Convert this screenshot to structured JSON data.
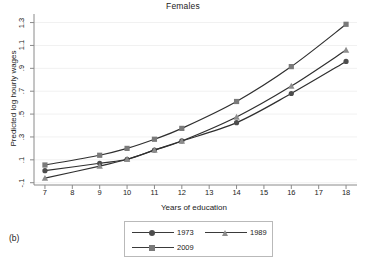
{
  "figure": {
    "panel_label": "(b)",
    "title": "Females"
  },
  "axes": {
    "xlabel": "Years of education",
    "ylabel": "Predicted log hourly wages",
    "xticks": [
      "7",
      "8",
      "9",
      "10",
      "11",
      "12",
      "13",
      "14",
      "15",
      "16",
      "17",
      "18"
    ],
    "yticks": [
      "-.1",
      ".1",
      ".3",
      ".5",
      ".7",
      ".9",
      "1.1",
      "1.3"
    ]
  },
  "legend": {
    "entries": [
      {
        "label": "1973",
        "marker": "circle-marker",
        "color": "#4d4d4d"
      },
      {
        "label": "1989",
        "marker": "triangle-marker",
        "color": "#8c8c8c"
      },
      {
        "label": "2009",
        "marker": "square-marker",
        "color": "#7a7a7a"
      }
    ]
  },
  "chart_data": {
    "type": "line",
    "title": "Females",
    "subtitle": "",
    "xlabel": "Years of education",
    "ylabel": "Predicted log hourly wages",
    "xlim": [
      6.6,
      18.4
    ],
    "ylim": [
      -0.12,
      1.34
    ],
    "xticks": [
      7,
      8,
      9,
      10,
      11,
      12,
      13,
      14,
      15,
      16,
      17,
      18
    ],
    "yticks": [
      -0.1,
      0.1,
      0.3,
      0.5,
      0.7,
      0.9,
      1.1,
      1.3
    ],
    "grid": false,
    "legend_position": "bottom",
    "x": [
      7,
      9,
      10,
      11,
      12,
      14,
      16,
      18
    ],
    "series": [
      {
        "name": "1973",
        "marker": "circle",
        "color": "#4d4d4d",
        "values": [
          0.005,
          0.07,
          0.105,
          0.185,
          0.265,
          0.425,
          0.68,
          0.96
        ]
      },
      {
        "name": "1989",
        "marker": "triangle",
        "color": "#8c8c8c",
        "values": [
          -0.06,
          0.045,
          0.105,
          0.185,
          0.265,
          0.475,
          0.745,
          1.06
        ]
      },
      {
        "name": "2009",
        "marker": "square",
        "color": "#7a7a7a",
        "values": [
          0.055,
          0.14,
          0.2,
          0.28,
          0.375,
          0.61,
          0.915,
          1.285
        ]
      }
    ]
  }
}
